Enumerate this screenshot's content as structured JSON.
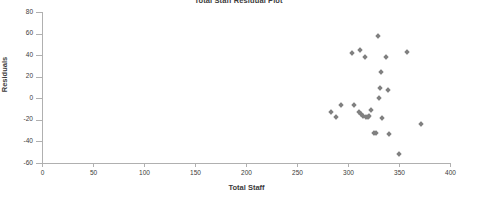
{
  "chart_data": {
    "type": "scatter",
    "title": "Total Staff Residual Plot",
    "xlabel": "Total Staff",
    "ylabel": "Residuals",
    "xlim": [
      0,
      400
    ],
    "ylim": [
      -60,
      80
    ],
    "xticks": [
      0,
      50,
      100,
      150,
      200,
      250,
      300,
      350,
      400
    ],
    "yticks": [
      -60,
      -40,
      -20,
      0,
      20,
      40,
      60,
      80
    ],
    "grid": false,
    "legend": false,
    "marker": {
      "shape": "diamond",
      "color": "#808080",
      "size": 4
    },
    "series": [
      {
        "name": "Residuals",
        "points": [
          {
            "x": 283,
            "y": -13
          },
          {
            "x": 288,
            "y": -17
          },
          {
            "x": 293,
            "y": -6
          },
          {
            "x": 304,
            "y": 42
          },
          {
            "x": 306,
            "y": -6
          },
          {
            "x": 312,
            "y": 45
          },
          {
            "x": 311,
            "y": -13
          },
          {
            "x": 313,
            "y": -15
          },
          {
            "x": 315,
            "y": -16
          },
          {
            "x": 317,
            "y": 38
          },
          {
            "x": 318,
            "y": -17
          },
          {
            "x": 320,
            "y": -17
          },
          {
            "x": 321,
            "y": -16
          },
          {
            "x": 323,
            "y": -11
          },
          {
            "x": 325,
            "y": -32
          },
          {
            "x": 327,
            "y": -32
          },
          {
            "x": 329,
            "y": 58
          },
          {
            "x": 330,
            "y": 0
          },
          {
            "x": 331,
            "y": 10
          },
          {
            "x": 332,
            "y": 24
          },
          {
            "x": 333,
            "y": -18
          },
          {
            "x": 337,
            "y": 38
          },
          {
            "x": 339,
            "y": 8
          },
          {
            "x": 340,
            "y": -33
          },
          {
            "x": 350,
            "y": -52
          },
          {
            "x": 358,
            "y": 43
          },
          {
            "x": 372,
            "y": -24
          }
        ]
      }
    ]
  }
}
